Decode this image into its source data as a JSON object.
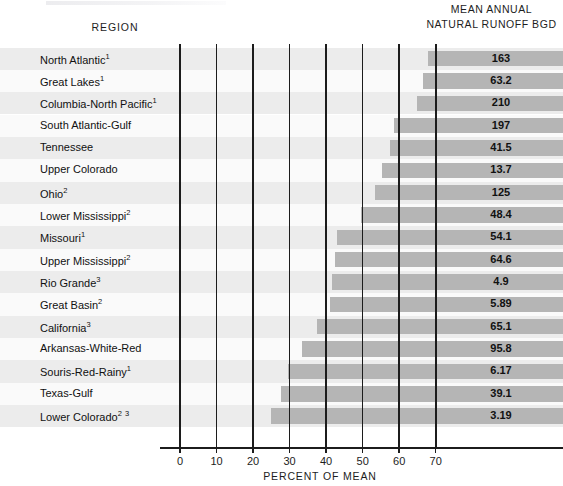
{
  "header": {
    "region_label": "REGION",
    "value_header_line1": "MEAN ANNUAL",
    "value_header_line2": "NATURAL RUNOFF BGD"
  },
  "axis": {
    "title": "PERCENT OF MEAN",
    "ticks": [
      0,
      10,
      20,
      30,
      40,
      50,
      60,
      70
    ]
  },
  "colors": {
    "bar": "#b5b5b5",
    "gridline": "#1c1c1c",
    "stripe_odd": "#ececec",
    "stripe_even": "#fafafa",
    "text": "#111111"
  },
  "chart_data": {
    "type": "bar",
    "orientation": "horizontal",
    "title": "",
    "subtitle": "",
    "xlabel": "PERCENT OF MEAN",
    "ylabel": "REGION",
    "xlim": [
      0,
      75
    ],
    "grid": true,
    "legend": "none",
    "value_column_header": "MEAN ANNUAL NATURAL RUNOFF BGD",
    "note": "Each bar spans from its region's percent-of-mean value rightward to the right edge of the chart; the numeric label is the mean annual natural runoff in BGD.",
    "categories": [
      "North Atlantic",
      "Great Lakes",
      "Columbia-North Pacific",
      "South Atlantic-Gulf",
      "Tennessee",
      "Upper Colorado",
      "Ohio",
      "Lower Mississippi",
      "Missouri",
      "Upper Mississippi",
      "Rio Grande",
      "Great Basin",
      "California",
      "Arkansas-White-Red",
      "Souris-Red-Rainy",
      "Texas-Gulf",
      "Lower Colorado"
    ],
    "footnotes": [
      "1",
      "1",
      "1",
      "",
      "",
      "",
      "2",
      "2",
      "1",
      "2",
      "3",
      "2",
      "3",
      "",
      "1",
      "",
      "2 3"
    ],
    "percent_of_mean": [
      68,
      66.4,
      65,
      58.7,
      57.5,
      55.4,
      53.4,
      49.6,
      43,
      42.3,
      41.6,
      41.1,
      37.6,
      33.5,
      29.7,
      27.7,
      24.8
    ],
    "runoff_bgd": [
      163,
      63.2,
      210,
      197,
      41.5,
      13.7,
      125,
      48.4,
      54.1,
      64.6,
      4.9,
      5.89,
      65.1,
      95.8,
      6.17,
      39.1,
      3.19
    ],
    "runoff_bgd_labels": [
      "163",
      "63.2",
      "210",
      "197",
      "41.5",
      "13.7",
      "125",
      "48.4",
      "54.1",
      "64.6",
      "4.9",
      "5.89",
      "65.1",
      "95.8",
      "6.17",
      "39.1",
      "3.19"
    ],
    "rows": [
      {
        "region": "North Atlantic",
        "footnote": "1",
        "percent_of_mean": 68,
        "runoff_bgd": "163"
      },
      {
        "region": "Great Lakes",
        "footnote": "1",
        "percent_of_mean": 66.4,
        "runoff_bgd": "63.2"
      },
      {
        "region": "Columbia-North Pacific",
        "footnote": "1",
        "percent_of_mean": 65,
        "runoff_bgd": "210"
      },
      {
        "region": "South Atlantic-Gulf",
        "footnote": "",
        "percent_of_mean": 58.7,
        "runoff_bgd": "197"
      },
      {
        "region": "Tennessee",
        "footnote": "",
        "percent_of_mean": 57.5,
        "runoff_bgd": "41.5"
      },
      {
        "region": "Upper Colorado",
        "footnote": "",
        "percent_of_mean": 55.4,
        "runoff_bgd": "13.7"
      },
      {
        "region": "Ohio",
        "footnote": "2",
        "percent_of_mean": 53.4,
        "runoff_bgd": "125"
      },
      {
        "region": "Lower Mississippi",
        "footnote": "2",
        "percent_of_mean": 49.6,
        "runoff_bgd": "48.4"
      },
      {
        "region": "Missouri",
        "footnote": "1",
        "percent_of_mean": 43,
        "runoff_bgd": "54.1"
      },
      {
        "region": "Upper Mississippi",
        "footnote": "2",
        "percent_of_mean": 42.3,
        "runoff_bgd": "64.6"
      },
      {
        "region": "Rio Grande",
        "footnote": "3",
        "percent_of_mean": 41.6,
        "runoff_bgd": "4.9"
      },
      {
        "region": "Great Basin",
        "footnote": "2",
        "percent_of_mean": 41.1,
        "runoff_bgd": "5.89"
      },
      {
        "region": "California",
        "footnote": "3",
        "percent_of_mean": 37.6,
        "runoff_bgd": "65.1"
      },
      {
        "region": "Arkansas-White-Red",
        "footnote": "",
        "percent_of_mean": 33.5,
        "runoff_bgd": "95.8"
      },
      {
        "region": "Souris-Red-Rainy",
        "footnote": "1",
        "percent_of_mean": 29.7,
        "runoff_bgd": "6.17"
      },
      {
        "region": "Texas-Gulf",
        "footnote": "",
        "percent_of_mean": 27.7,
        "runoff_bgd": "39.1"
      },
      {
        "region": "Lower Colorado",
        "footnote": "2 3",
        "percent_of_mean": 24.8,
        "runoff_bgd": "3.19"
      }
    ]
  }
}
